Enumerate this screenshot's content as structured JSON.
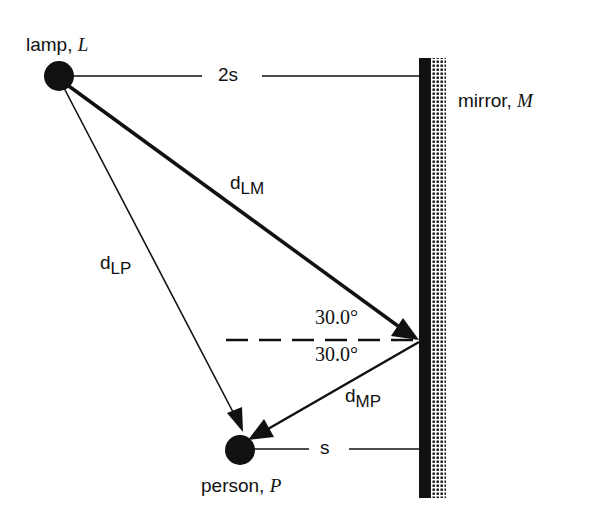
{
  "diagram": {
    "lamp": {
      "label": "lamp, ",
      "symbol": "L"
    },
    "mirror": {
      "label": "mirror, ",
      "symbol": "M"
    },
    "person": {
      "label": "person, ",
      "symbol": "P"
    },
    "distances": {
      "lamp_to_mirror_horizontal": "2s",
      "person_to_mirror_horizontal": "s",
      "d_LM": {
        "main": "d",
        "sub": "LM"
      },
      "d_LP": {
        "main": "d",
        "sub": "LP"
      },
      "d_MP": {
        "main": "d",
        "sub": "MP"
      }
    },
    "angles": {
      "incident": "30.0°",
      "reflected": "30.0°"
    },
    "colors": {
      "ink": "#111111",
      "background": "#ffffff"
    }
  }
}
